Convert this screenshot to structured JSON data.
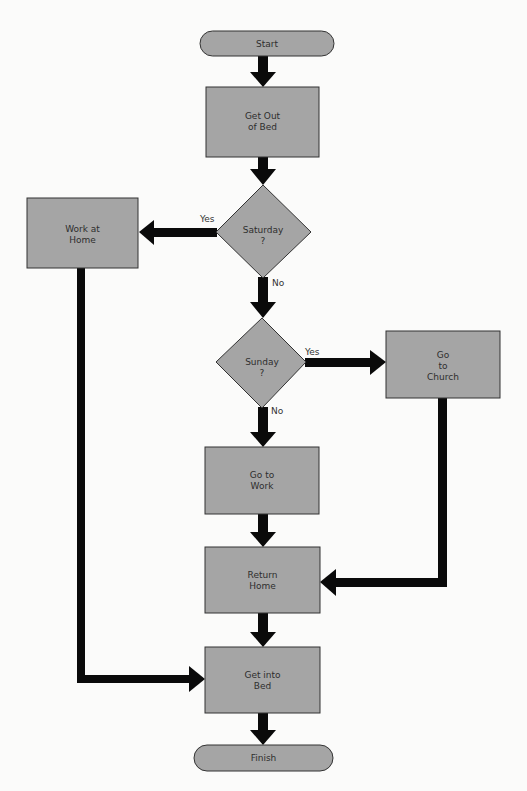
{
  "diagram": {
    "type": "flowchart",
    "colors": {
      "node_fill": "#a5a5a5",
      "node_stroke": "#333333",
      "arrow": "#0a0a0a",
      "background": "#fbfbfa"
    },
    "nodes": {
      "start": {
        "shape": "terminal",
        "lines": [
          "Start"
        ]
      },
      "get_out_of_bed": {
        "shape": "process",
        "lines": [
          "Get Out",
          "of Bed"
        ]
      },
      "saturday": {
        "shape": "decision",
        "lines": [
          "Saturday",
          "?"
        ]
      },
      "work_at_home": {
        "shape": "process",
        "lines": [
          "Work at",
          "Home"
        ]
      },
      "sunday": {
        "shape": "decision",
        "lines": [
          "Sunday",
          "?"
        ]
      },
      "go_to_church": {
        "shape": "process",
        "lines": [
          "Go",
          "to",
          "Church"
        ]
      },
      "go_to_work": {
        "shape": "process",
        "lines": [
          "Go to",
          "Work"
        ]
      },
      "return_home": {
        "shape": "process",
        "lines": [
          "Return",
          "Home"
        ]
      },
      "get_into_bed": {
        "shape": "process",
        "lines": [
          "Get into",
          "Bed"
        ]
      },
      "finish": {
        "shape": "terminal",
        "lines": [
          "Finish"
        ]
      }
    },
    "edges": [
      {
        "from": "start",
        "to": "get_out_of_bed",
        "label": ""
      },
      {
        "from": "get_out_of_bed",
        "to": "saturday",
        "label": ""
      },
      {
        "from": "saturday",
        "to": "work_at_home",
        "label": "Yes"
      },
      {
        "from": "saturday",
        "to": "sunday",
        "label": "No"
      },
      {
        "from": "sunday",
        "to": "go_to_church",
        "label": "Yes"
      },
      {
        "from": "sunday",
        "to": "go_to_work",
        "label": "No"
      },
      {
        "from": "go_to_work",
        "to": "return_home",
        "label": ""
      },
      {
        "from": "go_to_church",
        "to": "return_home",
        "label": ""
      },
      {
        "from": "return_home",
        "to": "get_into_bed",
        "label": ""
      },
      {
        "from": "work_at_home",
        "to": "get_into_bed",
        "label": ""
      },
      {
        "from": "get_into_bed",
        "to": "finish",
        "label": ""
      }
    ],
    "labels": {
      "saturday_yes": "Yes",
      "saturday_no": "No",
      "sunday_yes": "Yes",
      "sunday_no": "No"
    }
  }
}
